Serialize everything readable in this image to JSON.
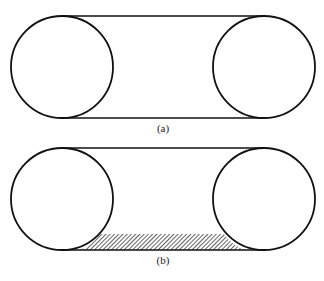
{
  "figures": [
    {
      "id": "a",
      "label": "(a)",
      "description": "Two circles connected by upper and lower tangent lines (belt around pulleys)",
      "left_circle": {
        "cx": 62,
        "cy": 67,
        "r": 51
      },
      "right_circle": {
        "cx": 264,
        "cy": 67,
        "r": 51
      },
      "hatched": false
    },
    {
      "id": "b",
      "label": "(b)",
      "description": "Two circles connected by tangent lines, with hatched region along the lower span between circles",
      "left_circle": {
        "cx": 62,
        "cy": 199,
        "r": 51
      },
      "right_circle": {
        "cx": 264,
        "cy": 199,
        "r": 51
      },
      "hatched": true,
      "hatch_region": {
        "top_y": 234,
        "bottom_y": 250
      }
    }
  ],
  "colors": {
    "stroke": "#111111",
    "background": "#ffffff"
  }
}
